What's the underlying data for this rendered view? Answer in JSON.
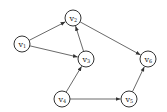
{
  "diagram": {
    "type": "directed-graph",
    "nodes": [
      {
        "id": "v1",
        "label": "v",
        "sub": "1",
        "x": 22,
        "y": 44
      },
      {
        "id": "v2",
        "label": "v",
        "sub": "2",
        "x": 73,
        "y": 18
      },
      {
        "id": "v3",
        "label": "v",
        "sub": "3",
        "x": 86,
        "y": 59
      },
      {
        "id": "v4",
        "label": "v",
        "sub": "4",
        "x": 62,
        "y": 99
      },
      {
        "id": "v5",
        "label": "v",
        "sub": "5",
        "x": 129,
        "y": 99
      },
      {
        "id": "v6",
        "label": "v",
        "sub": "6",
        "x": 148,
        "y": 59
      }
    ],
    "edges": [
      {
        "from": "v1",
        "to": "v2"
      },
      {
        "from": "v1",
        "to": "v3"
      },
      {
        "from": "v3",
        "to": "v2"
      },
      {
        "from": "v2",
        "to": "v6"
      },
      {
        "from": "v4",
        "to": "v3"
      },
      {
        "from": "v4",
        "to": "v5"
      },
      {
        "from": "v5",
        "to": "v6"
      }
    ]
  }
}
